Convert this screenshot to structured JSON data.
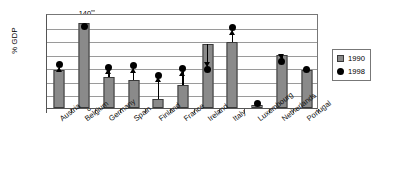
{
  "chart_data": {
    "type": "bar",
    "title": "",
    "xlabel": "",
    "ylabel": "% GDP",
    "ylim": [
      0,
      140
    ],
    "ytick_step": 20,
    "yticks": [
      140,
      120,
      100,
      80,
      60,
      40,
      20,
      0
    ],
    "grid": true,
    "legend_position": "right",
    "categories": [
      "Austria",
      "Belgium",
      "Germany",
      "Spain",
      "Finland",
      "France",
      "Ireland",
      "Italy",
      "Luxembourg",
      "Netherlands",
      "Portugal"
    ],
    "series": [
      {
        "name": "1990",
        "marker": "gray-square-bar",
        "values": [
          56,
          125,
          45,
          41,
          13,
          34,
          95,
          97,
          4,
          78,
          56
        ]
      },
      {
        "name": "1998",
        "marker": "black-dot",
        "values": [
          64,
          120,
          60,
          62,
          48,
          58,
          57,
          118,
          7,
          69,
          57
        ]
      }
    ],
    "annotations": [
      {
        "category": "Austria",
        "direction": "up",
        "from": 56,
        "to": 64
      },
      {
        "category": "Belgium",
        "direction": "down",
        "from": 125,
        "to": 120
      },
      {
        "category": "Germany",
        "direction": "up",
        "from": 45,
        "to": 60
      },
      {
        "category": "Spain",
        "direction": "up",
        "from": 41,
        "to": 62
      },
      {
        "category": "Finland",
        "direction": "up",
        "from": 13,
        "to": 48
      },
      {
        "category": "France",
        "direction": "up",
        "from": 34,
        "to": 58
      },
      {
        "category": "Ireland",
        "direction": "down",
        "from": 95,
        "to": 57
      },
      {
        "category": "Italy",
        "direction": "up",
        "from": 97,
        "to": 118
      },
      {
        "category": "Luxembourg",
        "direction": "up",
        "from": 4,
        "to": 7
      },
      {
        "category": "Netherlands",
        "direction": "down",
        "from": 78,
        "to": 69
      },
      {
        "category": "Portugal",
        "direction": "up",
        "from": 56,
        "to": 57
      }
    ]
  },
  "legend": {
    "items": [
      {
        "label": "1990",
        "icon": "gray-square-icon",
        "color": "#8a8a8a"
      },
      {
        "label": "1998",
        "icon": "black-dot-icon",
        "color": "#000000"
      }
    ]
  },
  "colors": {
    "bar_fill": "#8a8a8a",
    "bar_stroke": "#3a3a3a",
    "marker": "#000000",
    "gridline": "#9a9a9a",
    "axis": "#555555",
    "background": "#ffffff"
  }
}
